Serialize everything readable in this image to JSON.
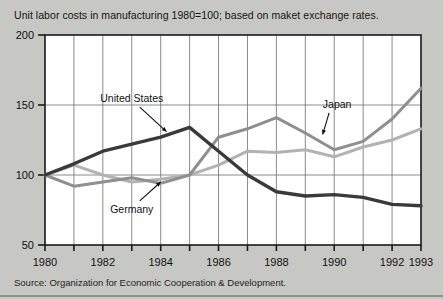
{
  "header": {
    "clipped_top_text": "",
    "subtitle": "Unit labor costs in manufacturing 1980=100; based on maket exchange rates."
  },
  "footer": {
    "source": "Source: Organization for Economic Cooperation & Development."
  },
  "colors": {
    "background": "#c7c7c3",
    "plot_background": "#ffffff",
    "axis": "#1a1a1a",
    "grid": "#6d6d6d",
    "united_states": "#3a3a3a",
    "japan": "#8f8f8f",
    "germany": "#b2b2b2"
  },
  "chart_data": {
    "type": "line",
    "title": "Unit labor costs in manufacturing 1980=100; based on maket exchange rates.",
    "xlabel": "",
    "ylabel": "",
    "xlim": [
      1980,
      1993
    ],
    "ylim": [
      50,
      200
    ],
    "yticks": [
      50,
      100,
      150,
      200
    ],
    "ytick_labels": [
      "50",
      "100",
      "150",
      "200"
    ],
    "xticks": [
      1980,
      1981,
      1982,
      1983,
      1984,
      1985,
      1986,
      1987,
      1988,
      1989,
      1990,
      1991,
      1992,
      1993
    ],
    "xtick_labels": [
      "1980",
      "1982",
      "1984",
      "1986",
      "1988",
      "1990",
      "1992",
      "1993"
    ],
    "xtick_label_years": [
      1980,
      1982,
      1984,
      1986,
      1988,
      1990,
      1992,
      1993
    ],
    "grid": true,
    "grid_x": true,
    "grid_y": true,
    "legend": "inline-annotations",
    "x": [
      1980,
      1981,
      1982,
      1983,
      1984,
      1985,
      1986,
      1987,
      1988,
      1989,
      1990,
      1991,
      1992,
      1993
    ],
    "series": [
      {
        "name": "United States",
        "color": "#3a3a3a",
        "values": [
          100,
          108,
          117,
          122,
          127,
          134,
          117,
          100,
          88,
          85,
          86,
          84,
          79,
          78
        ]
      },
      {
        "name": "Japan",
        "color": "#8f8f8f",
        "values": [
          100,
          92,
          95,
          98,
          94,
          100,
          127,
          133,
          141,
          130,
          118,
          124,
          140,
          162
        ]
      },
      {
        "name": "Germany",
        "color": "#b2b2b2",
        "values": [
          100,
          107,
          100,
          95,
          97,
          100,
          107,
          117,
          116,
          118,
          113,
          120,
          125,
          133
        ]
      }
    ],
    "annotations": [
      {
        "text": "United States",
        "x": 1983.0,
        "y": 152,
        "arrow_to_x": 1984.2,
        "arrow_to_y": 131
      },
      {
        "text": "Japan",
        "x": 1990.1,
        "y": 148,
        "arrow_to_x": 1989.6,
        "arrow_to_y": 129
      },
      {
        "text": "Germany",
        "x": 1983.0,
        "y": 73,
        "arrow_to_x": 1984.0,
        "arrow_to_y": 95
      }
    ]
  }
}
